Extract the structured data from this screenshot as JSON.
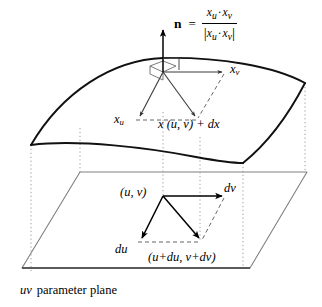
{
  "figure": {
    "caption_symbol": "uv",
    "caption_text": "parameter plane"
  },
  "normal_formula": {
    "symbol": "n",
    "equals": "=",
    "numerator_left": "x",
    "numerator_left_sub": "u",
    "dot": "·",
    "numerator_right": "x",
    "numerator_right_sub": "v",
    "denominator_bar_open": "|",
    "denominator_left": "x",
    "denominator_left_sub": "u",
    "denominator_right": "x",
    "denominator_right_sub": "v",
    "denominator_bar_close": "|"
  },
  "surface_labels": {
    "xv": {
      "base": "x",
      "sub": "v"
    },
    "xu": {
      "base": "x",
      "sub": "u"
    },
    "point": "x (u, v) + dx"
  },
  "plane_labels": {
    "uv_point": "(u, v)",
    "dv": "dv",
    "du": "du",
    "offset_point": "(u+du, v+dv)"
  },
  "colors": {
    "stroke": "#000000",
    "surface_edge": "#1a1a1a",
    "plane_edge": "#777777",
    "dotted_projection": "#999999",
    "dashed_helper": "#555555",
    "background": "#ffffff"
  },
  "geometry": {
    "surface_vertices": {
      "left": [
        31,
        145
      ],
      "top_apex": [
        163,
        58
      ],
      "right_top": [
        305,
        83
      ],
      "right_bottom": [
        243,
        163
      ]
    },
    "plane_vertices": {
      "top_left": [
        80,
        172
      ],
      "top_right": [
        307,
        172
      ],
      "bottom_right": [
        250,
        268
      ],
      "bottom_left": [
        22,
        268
      ]
    },
    "normal_arrow": {
      "from": [
        163,
        72
      ],
      "to": [
        163,
        28
      ]
    },
    "tangent_origin": [
      163,
      72
    ],
    "xv_arrow_to": [
      224,
      72
    ],
    "xu_arrow_to": [
      138,
      118
    ],
    "dx_arrow_to": [
      196,
      118
    ],
    "uv_origin": [
      163,
      196
    ],
    "dv_arrow_to": [
      224,
      196
    ],
    "du_arrow_to": [
      141,
      240
    ],
    "dtotal_arrow_to": [
      200,
      240
    ]
  }
}
